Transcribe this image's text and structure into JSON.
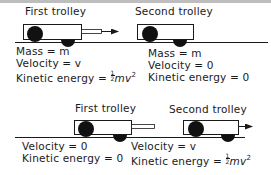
{
  "figure": {
    "scenes": [
      {
        "id": "before",
        "trolleys": [
          {
            "label": "First trolley",
            "state": {
              "mass": "Mass = m",
              "velocity": "Velocity = v",
              "kinetic_energy_prefix": "Kinetic energy = ",
              "kinetic_energy_expr": "mv",
              "kinetic_energy_exp": "2",
              "kinetic_energy_frac": [
                "1",
                "2"
              ]
            },
            "has_plunger": true,
            "arrow": "right"
          },
          {
            "label": "Second trolley",
            "state": {
              "mass": "Mass = m",
              "velocity": "Velocity = 0",
              "kinetic_energy": "Kinetic energy = 0"
            },
            "has_plunger": false,
            "arrow": "none"
          }
        ]
      },
      {
        "id": "after",
        "trolleys": [
          {
            "label": "First trolley",
            "state": {
              "velocity": "Velocity = 0",
              "kinetic_energy": "Kinetic energy = 0"
            },
            "has_plunger": true,
            "arrow": "none"
          },
          {
            "label": "Second trolley",
            "state": {
              "velocity": "Velocity = v",
              "kinetic_energy_prefix": "Kinetic energy = ",
              "kinetic_energy_expr": "mv",
              "kinetic_energy_exp": "2",
              "kinetic_energy_frac": [
                "1",
                "2"
              ]
            },
            "has_plunger": false,
            "arrow": "right"
          }
        ]
      }
    ],
    "colors": {
      "ink": "#1a1a1a",
      "background": "#ffffff",
      "top_strip": "#bdbdbd"
    }
  }
}
